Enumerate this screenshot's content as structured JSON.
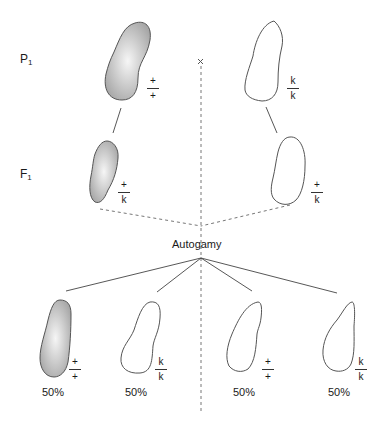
{
  "diagram": {
    "generations": [
      {
        "label": "P",
        "sub": "1"
      },
      {
        "label": "F",
        "sub": "1"
      }
    ],
    "cross_symbol": "×",
    "process_label": "Autogamy",
    "colors": {
      "stroke": "#555555",
      "fill_center": "#f4f4f4",
      "fill_edge": "#a9a9a9",
      "line": "#444444"
    },
    "p1": [
      {
        "id": "p1-left",
        "allele_top": "+",
        "allele_bottom": "+",
        "shaded": true
      },
      {
        "id": "p1-right",
        "allele_top": "k",
        "allele_bottom": "k",
        "shaded": false
      }
    ],
    "f1": [
      {
        "id": "f1-left",
        "allele_top": "+",
        "allele_bottom": "k",
        "shaded": true
      },
      {
        "id": "f1-right",
        "allele_top": "+",
        "allele_bottom": "k",
        "shaded": false
      }
    ],
    "offspring": [
      {
        "id": "off-1",
        "allele_top": "+",
        "allele_bottom": "+",
        "shaded": true,
        "percent": "50%"
      },
      {
        "id": "off-2",
        "allele_top": "k",
        "allele_bottom": "k",
        "shaded": false,
        "percent": "50%"
      },
      {
        "id": "off-3",
        "allele_top": "+",
        "allele_bottom": "+",
        "shaded": false,
        "percent": "50%"
      },
      {
        "id": "off-4",
        "allele_top": "k",
        "allele_bottom": "k",
        "shaded": false,
        "percent": "50%"
      }
    ]
  }
}
